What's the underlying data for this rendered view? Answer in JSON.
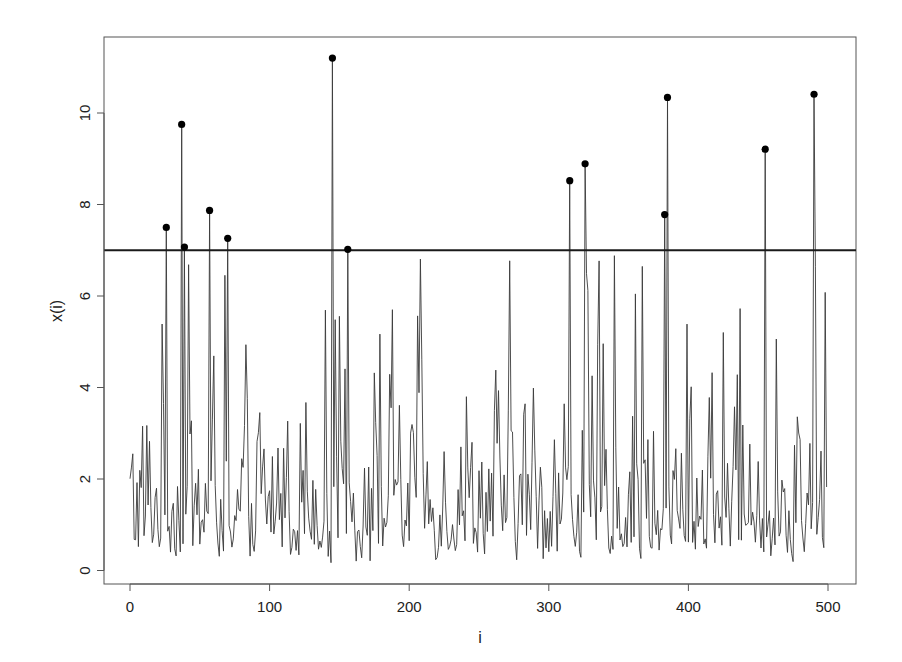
{
  "chart_data": {
    "type": "line",
    "title": "",
    "xlabel": "i",
    "ylabel": "x(i)",
    "xlim": [
      -20,
      520
    ],
    "ylim": [
      -0.3,
      11.5
    ],
    "xticks": [
      0,
      100,
      200,
      300,
      400,
      500
    ],
    "yticks": [
      0,
      2,
      4,
      6,
      8,
      10
    ],
    "grid": false,
    "legend": null,
    "threshold": {
      "value": 7,
      "color": "#1a1a1a"
    },
    "series_color": "#3a3a3a",
    "point_color": "#000000",
    "n": 500,
    "seed": 1234,
    "exceedances": [
      {
        "i": 26,
        "x": 7.5
      },
      {
        "i": 37,
        "x": 9.75
      },
      {
        "i": 39,
        "x": 7.07
      },
      {
        "i": 57,
        "x": 7.87
      },
      {
        "i": 70,
        "x": 7.26
      },
      {
        "i": 145,
        "x": 11.2
      },
      {
        "i": 156,
        "x": 7.02
      },
      {
        "i": 315,
        "x": 8.52
      },
      {
        "i": 326,
        "x": 8.89
      },
      {
        "i": 383,
        "x": 7.78
      },
      {
        "i": 385,
        "x": 10.34
      },
      {
        "i": 455,
        "x": 9.21
      },
      {
        "i": 490,
        "x": 10.41
      }
    ]
  },
  "labels": {
    "xlabel": "i",
    "ylabel": "x(i)",
    "xticks": [
      "0",
      "100",
      "200",
      "300",
      "400",
      "500"
    ],
    "yticks": [
      "0",
      "2",
      "4",
      "6",
      "8",
      "10"
    ]
  }
}
